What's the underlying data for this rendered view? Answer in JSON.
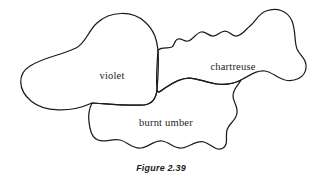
{
  "figure": {
    "caption": "Figure 2.39",
    "background_color": "#ffffff",
    "stroke_color": "#1c1c1c",
    "stroke_width": 1.25
  },
  "regions": [
    {
      "id": "violet",
      "label": "violet",
      "label_x": 112,
      "label_y": 77,
      "description": "Large rounded blob at left with a tapering tail curling to the lower-left",
      "path": "M 92 103 C 70 113, 44 112, 31 101 C 18 90, 17 74, 30 66 C 44 57, 62 55, 76 48 C 86 43, 88 31, 97 23 C 110 11, 132 10, 145 22 C 155 31, 157 41, 158 50 C 159 63, 158 78, 157 90 C 156 99, 152 104, 144 105 C 128 106, 108 104, 92 103 Z"
    },
    {
      "id": "chartreuse",
      "label": "chartreuse",
      "label_x": 233,
      "label_y": 68,
      "description": "Wavy-topped blob at right with a tall rounded lobe on the upper right and a bulge at the far right",
      "path": "M 158 50 C 163 46, 168 49, 172 47 C 175 45, 174 40, 178 39 C 182 38, 184 42, 188 41 C 193 40, 196 33, 201 32 C 206 31, 208 36, 213 36 C 218 36, 220 31, 225 31 C 230 31, 231 36, 236 36 C 242 36, 245 30, 250 26 C 256 21, 258 14, 266 11 C 277 7, 288 11, 292 21 C 296 31, 294 41, 297 49 C 300 56, 307 59, 306 68 C 305 78, 294 82, 285 80 C 277 78, 272 72, 265 71 C 256 70, 249 76, 241 80 C 233 84, 225 85, 217 84 C 207 83, 198 78, 189 78 C 180 78, 172 83, 165 88 C 161 91, 158 94, 157 90 C 156 78, 157 63, 158 50 Z"
    },
    {
      "id": "burnt-umber",
      "label": "burnt umber",
      "label_x": 166,
      "label_y": 124,
      "description": "Wide scalloped blob across the bottom overlapping the other two",
      "path": "M 92 103 C 108 104, 128 106, 144 105 C 152 104, 156 99, 157 90 C 158 94, 161 91, 165 88 C 172 83, 180 78, 189 78 C 198 78, 207 83, 217 84 C 225 85, 233 84, 241 80 C 238 86, 233 89, 233 96 C 233 102, 238 106, 237 113 C 236 121, 229 123, 227 130 C 225 137, 229 144, 223 148 C 216 152, 211 144, 204 142 C 196 140, 190 147, 182 148 C 174 149, 170 142, 162 141 C 154 140, 149 147, 141 148 C 132 149, 128 142, 120 140 C 112 138, 105 143, 98 140 C 91 137, 90 129, 89 122 C 88 115, 89 109, 92 103 Z"
    }
  ]
}
